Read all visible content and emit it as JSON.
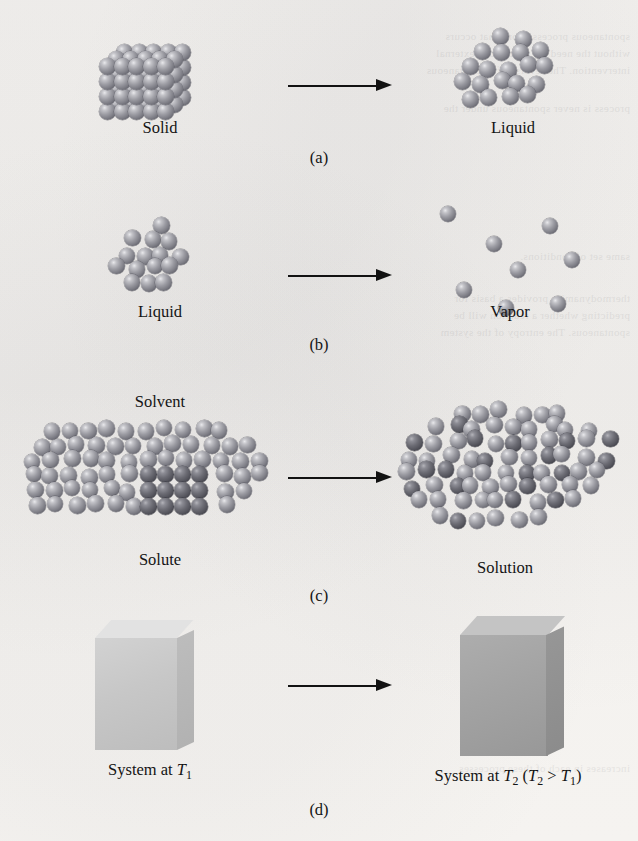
{
  "figure": {
    "background_color": "#f5f3f0",
    "sphere_color_solvent": "#7e7e86",
    "sphere_color_solute": "#56565e",
    "box_color_cool": "#c7c7c7",
    "box_color_warm": "#a3a3a3",
    "arrow_color": "#121212"
  },
  "panels": [
    {
      "letter": "(a)",
      "left": {
        "label": "Solid",
        "state": "solid-lattice"
      },
      "right": {
        "label": "Liquid",
        "state": "liquid-cluster"
      }
    },
    {
      "letter": "(b)",
      "left": {
        "label": "Liquid",
        "state": "liquid-cluster"
      },
      "right": {
        "label": "Vapor",
        "state": "vapor-scatter"
      }
    },
    {
      "letter": "(c)",
      "left": {
        "label_top": "Solvent",
        "label_bottom": "Solute",
        "state": "solvent-with-solute-crystal"
      },
      "right": {
        "label": "Solution",
        "state": "solution-mixed"
      }
    },
    {
      "letter": "(d)",
      "left": {
        "label_prefix": "System at ",
        "label_symbol": "T",
        "label_sub": "1",
        "state": "box-cool"
      },
      "right": {
        "label_prefix": "System at ",
        "label_symbol": "T",
        "label_sub": "2",
        "label_paren_open": " (",
        "label_cmp_symbol": "T",
        "label_cmp_sub": "2",
        "label_cmp_op": " > ",
        "label_cmp_symbol2": "T",
        "label_cmp_sub2": "1",
        "label_paren_close": ")",
        "state": "box-warm"
      }
    }
  ],
  "ghost_text": [
    {
      "x": 8,
      "y": 28,
      "text": "spontaneous process is one that occurs"
    },
    {
      "x": 8,
      "y": 45,
      "text": "without the need for continuous external"
    },
    {
      "x": 8,
      "y": 62,
      "text": "intervention. The reverse of a spontaneous"
    },
    {
      "x": 8,
      "y": 100,
      "text": "process is never spontaneous under the"
    },
    {
      "x": 8,
      "y": 248,
      "text": "same set of conditions."
    },
    {
      "x": 8,
      "y": 290,
      "text": "thermodynamics provides a basis for"
    },
    {
      "x": 8,
      "y": 307,
      "text": "predicting whether a reaction will be"
    },
    {
      "x": 8,
      "y": 324,
      "text": "spontaneous. The entropy of the system"
    },
    {
      "x": 8,
      "y": 760,
      "text": "increases in each of these processes"
    }
  ]
}
